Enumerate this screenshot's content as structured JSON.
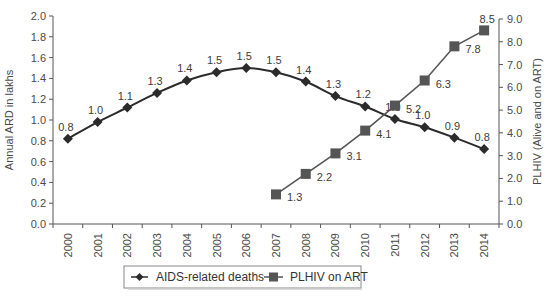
{
  "chart_data": {
    "type": "line",
    "title": "",
    "xlabel": "",
    "categories": [
      "2000",
      "2001",
      "2002",
      "2003",
      "2004",
      "2005",
      "2006",
      "2007",
      "2008",
      "2009",
      "2010",
      "2011",
      "2012",
      "2013",
      "2014"
    ],
    "y_left": {
      "label": "Annual ARD in lakhs",
      "range": [
        0.0,
        2.0
      ],
      "ticks": [
        "0.0",
        "0.2",
        "0.4",
        "0.6",
        "0.8",
        "1.0",
        "1.2",
        "1.4",
        "1.6",
        "1.8",
        "2.0"
      ]
    },
    "y_right": {
      "label": "PLHIV (Alive and on ART)",
      "range": [
        0.0,
        9.0
      ],
      "ticks": [
        "0.0",
        "1.0",
        "2.0",
        "3.0",
        "4.0",
        "5.0",
        "6.0",
        "7.0",
        "8.0",
        "9.0"
      ]
    },
    "series": [
      {
        "name": "AIDS-related deaths",
        "axis": "left",
        "marker": "diamond",
        "color": "#2b2b2b",
        "x": [
          "2000",
          "2001",
          "2002",
          "2003",
          "2004",
          "2005",
          "2006",
          "2007",
          "2008",
          "2009",
          "2010",
          "2011",
          "2012",
          "2013",
          "2014"
        ],
        "values": [
          0.82,
          0.98,
          1.12,
          1.26,
          1.38,
          1.46,
          1.5,
          1.46,
          1.37,
          1.23,
          1.13,
          1.01,
          0.93,
          0.83,
          0.72
        ],
        "labels": [
          "0.8",
          "1.0",
          "1.1",
          "1.3",
          "1.4",
          "1.5",
          "1.5",
          "1.5",
          "1.4",
          "1.3",
          "1.2",
          "1.0",
          "1.0",
          "0.9",
          "0.8"
        ]
      },
      {
        "name": "PLHIV on ART",
        "axis": "right",
        "marker": "square",
        "color": "#555555",
        "x": [
          "2007",
          "2008",
          "2009",
          "2010",
          "2011",
          "2012",
          "2013",
          "2014"
        ],
        "values": [
          1.3,
          2.2,
          3.1,
          4.1,
          5.2,
          6.3,
          7.8,
          8.5
        ],
        "labels": [
          "1.3",
          "2.2",
          "3.1",
          "4.1",
          "5.2",
          "6.3",
          "7.8",
          "8.5"
        ]
      }
    ],
    "legend": {
      "position": "bottom",
      "entries": [
        "AIDS-related deaths",
        "PLHIV on ART"
      ]
    },
    "grid": false
  }
}
